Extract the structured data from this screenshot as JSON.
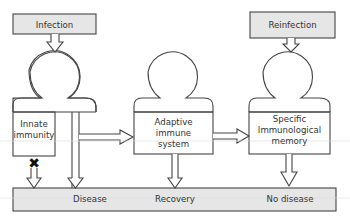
{
  "diagram": {
    "inputs": {
      "infection": "Infection",
      "reinfection": "Reinfection"
    },
    "nodes": {
      "innate_line1": "Innate",
      "innate_line2": "immunity",
      "adaptive_line1": "Adaptive",
      "adaptive_line2": "immune",
      "adaptive_line3": "system",
      "memory_line1": "Specific",
      "memory_line2": "Immunological",
      "memory_line3": "memory"
    },
    "outcomes": {
      "disease": "Disease",
      "recovery": "Recovery",
      "no_disease": "No disease"
    },
    "blocked_marker": "✖",
    "colors": {
      "box_fill": "#e6e6e6",
      "stroke": "#444444",
      "background": "#ffffff"
    }
  }
}
